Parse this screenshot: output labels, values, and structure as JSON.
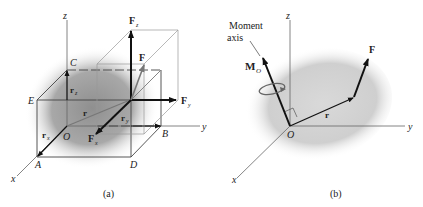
{
  "panel_a": {
    "caption": "(a)",
    "axes": {
      "x": "x",
      "y": "y",
      "z": "z"
    },
    "points": {
      "O": "O",
      "A": "A",
      "B": "B",
      "C": "C",
      "D": "D",
      "E": "E"
    },
    "vectors": {
      "r": "r",
      "rx": "r",
      "rx_sub": "x",
      "ry": "r",
      "ry_sub": "y",
      "rz": "r",
      "rz_sub": "z",
      "F": "F",
      "Fx": "F",
      "Fx_sub": "x",
      "Fy": "F",
      "Fy_sub": "y",
      "Fz": "F",
      "Fz_sub": "z"
    }
  },
  "panel_b": {
    "caption": "(b)",
    "axes": {
      "x": "x",
      "y": "y",
      "z": "z"
    },
    "origin": "O",
    "moment_axis_line1": "Moment",
    "moment_axis_line2": "axis",
    "moment_vector": "M",
    "moment_sub": "O",
    "r": "r",
    "F": "F"
  },
  "colors": {
    "line": "#555555",
    "vector": "#111111",
    "force_gray": "#777777",
    "blob": "#9a9a9a"
  }
}
